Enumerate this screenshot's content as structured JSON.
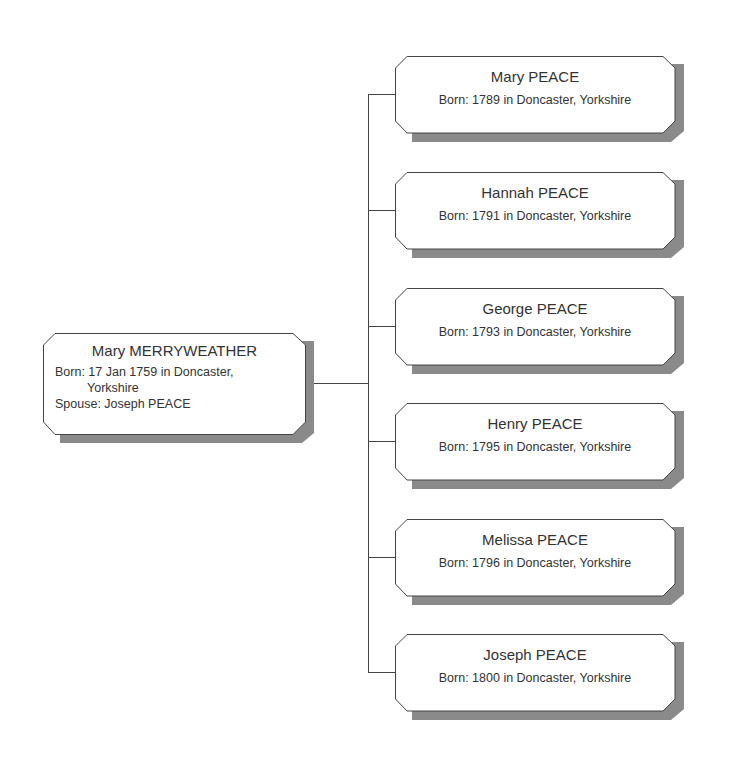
{
  "root": {
    "name": "Mary MERRYWEATHER",
    "born_line1": "Born: 17 Jan 1759 in Doncaster,",
    "born_line2": "Yorkshire",
    "spouse": "Spouse: Joseph PEACE"
  },
  "children": [
    {
      "name": "Mary PEACE",
      "born": "Born: 1789 in Doncaster, Yorkshire"
    },
    {
      "name": "Hannah PEACE",
      "born": "Born: 1791 in Doncaster, Yorkshire"
    },
    {
      "name": "George PEACE",
      "born": "Born: 1793 in Doncaster, Yorkshire"
    },
    {
      "name": "Henry PEACE",
      "born": "Born: 1795 in Doncaster, Yorkshire"
    },
    {
      "name": "Melissa PEACE",
      "born": "Born: 1796 in Doncaster, Yorkshire"
    },
    {
      "name": "Joseph PEACE",
      "born": "Born: 1800 in Doncaster, Yorkshire"
    }
  ],
  "colors": {
    "box_fill": "#ffffff",
    "box_border": "#444444",
    "shadow": "#8a8a8a",
    "text": "#333333",
    "connector": "#444444"
  }
}
